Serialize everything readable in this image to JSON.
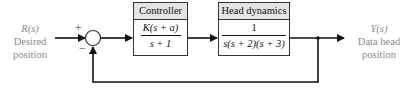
{
  "input": {
    "symbol": "R(s)",
    "line1": "Desired",
    "line2": "position"
  },
  "output": {
    "symbol": "Y(s)",
    "line1": "Data head",
    "line2": "position"
  },
  "summing_junction": {
    "plus_sign": "+",
    "minus_sign": "−"
  },
  "blocks": [
    {
      "title": "Controller",
      "numerator": "K(s + a)",
      "denominator": "s + 1"
    },
    {
      "title": "Head dynamics",
      "numerator": "1",
      "denominator": "s(s + 2)(s + 3)"
    }
  ],
  "colors": {
    "line": "#111111",
    "label": "#8a8a8a",
    "header_bg": "#e4e4e4"
  }
}
